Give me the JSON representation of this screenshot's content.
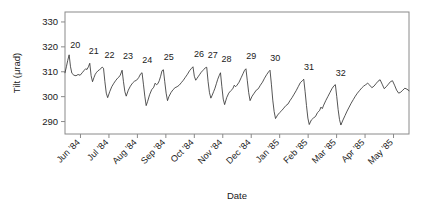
{
  "chart_data": {
    "type": "line",
    "title": "",
    "subtitle": "",
    "xlabel": "Date",
    "ylabel": "Tilt (μrad)",
    "ylim": [
      285,
      334
    ],
    "yticks": [
      290,
      300,
      310,
      320,
      330
    ],
    "ytick_labels": [
      "290",
      "300",
      "310",
      "320",
      "330"
    ],
    "xlim": [
      "1984-05-15",
      "1985-06-05"
    ],
    "xtick_labels": [
      "Jun '84",
      "Jul '84",
      "Aug '84",
      "Sep '84",
      "Oct '84",
      "Nov '84",
      "Dec '84",
      "Jan '85",
      "Feb '85",
      "Mar '85",
      "Apr '85",
      "May '85"
    ],
    "grid": false,
    "legend": null,
    "legend_position": "none",
    "line_color": "#2b2b2b",
    "frame_color": "#8a8a8a",
    "annotations": [
      {
        "label": "20",
        "x": 0.012,
        "y": 317.2
      },
      {
        "label": "21",
        "x": 0.066,
        "y": 315.0
      },
      {
        "label": "22",
        "x": 0.112,
        "y": 313.5
      },
      {
        "label": "23",
        "x": 0.166,
        "y": 312.8
      },
      {
        "label": "24",
        "x": 0.222,
        "y": 311.5
      },
      {
        "label": "25",
        "x": 0.284,
        "y": 312.7
      },
      {
        "label": "26",
        "x": 0.372,
        "y": 313.8
      },
      {
        "label": "27",
        "x": 0.412,
        "y": 313.2
      },
      {
        "label": "28",
        "x": 0.452,
        "y": 311.6
      },
      {
        "label": "29",
        "x": 0.524,
        "y": 312.9
      },
      {
        "label": "30",
        "x": 0.594,
        "y": 312.0
      },
      {
        "label": "31",
        "x": 0.692,
        "y": 308.6
      },
      {
        "label": "32",
        "x": 0.784,
        "y": 306.2
      }
    ],
    "series": [
      {
        "name": "Tilt",
        "comment": "Sawtooth: each cycle ramps up slowly then drops sharply. Values in microradians.",
        "points": [
          [
            0.0,
            309.6
          ],
          [
            0.004,
            312.0
          ],
          [
            0.008,
            314.6
          ],
          [
            0.012,
            316.8
          ],
          [
            0.016,
            312.0
          ],
          [
            0.02,
            309.4
          ],
          [
            0.026,
            308.6
          ],
          [
            0.032,
            308.4
          ],
          [
            0.038,
            308.9
          ],
          [
            0.044,
            308.6
          ],
          [
            0.05,
            309.6
          ],
          [
            0.056,
            310.6
          ],
          [
            0.06,
            311.2
          ],
          [
            0.064,
            310.9
          ],
          [
            0.068,
            312.0
          ],
          [
            0.072,
            313.4
          ],
          [
            0.076,
            308.4
          ],
          [
            0.08,
            306.0
          ],
          [
            0.084,
            307.6
          ],
          [
            0.088,
            309.0
          ],
          [
            0.092,
            309.8
          ],
          [
            0.096,
            310.4
          ],
          [
            0.1,
            310.8
          ],
          [
            0.104,
            311.2
          ],
          [
            0.108,
            311.9
          ],
          [
            0.112,
            311.4
          ],
          [
            0.116,
            306.0
          ],
          [
            0.12,
            301.4
          ],
          [
            0.124,
            299.6
          ],
          [
            0.13,
            302.0
          ],
          [
            0.136,
            304.0
          ],
          [
            0.142,
            305.4
          ],
          [
            0.148,
            306.6
          ],
          [
            0.154,
            307.6
          ],
          [
            0.16,
            308.4
          ],
          [
            0.166,
            310.6
          ],
          [
            0.17,
            306.0
          ],
          [
            0.174,
            302.0
          ],
          [
            0.178,
            300.2
          ],
          [
            0.184,
            302.6
          ],
          [
            0.19,
            304.2
          ],
          [
            0.196,
            305.4
          ],
          [
            0.202,
            306.2
          ],
          [
            0.208,
            306.6
          ],
          [
            0.214,
            307.6
          ],
          [
            0.22,
            309.2
          ],
          [
            0.224,
            309.6
          ],
          [
            0.228,
            305.0
          ],
          [
            0.232,
            300.2
          ],
          [
            0.236,
            296.4
          ],
          [
            0.24,
            298.0
          ],
          [
            0.246,
            300.8
          ],
          [
            0.252,
            302.8
          ],
          [
            0.258,
            303.8
          ],
          [
            0.262,
            305.4
          ],
          [
            0.266,
            304.8
          ],
          [
            0.27,
            305.2
          ],
          [
            0.274,
            306.4
          ],
          [
            0.278,
            308.2
          ],
          [
            0.282,
            310.4
          ],
          [
            0.286,
            310.8
          ],
          [
            0.29,
            306.0
          ],
          [
            0.294,
            301.4
          ],
          [
            0.298,
            298.4
          ],
          [
            0.302,
            300.0
          ],
          [
            0.308,
            301.6
          ],
          [
            0.314,
            302.8
          ],
          [
            0.32,
            303.6
          ],
          [
            0.326,
            304.0
          ],
          [
            0.332,
            304.6
          ],
          [
            0.338,
            305.6
          ],
          [
            0.344,
            306.6
          ],
          [
            0.35,
            307.8
          ],
          [
            0.356,
            309.0
          ],
          [
            0.362,
            310.4
          ],
          [
            0.368,
            311.4
          ],
          [
            0.372,
            312.0
          ],
          [
            0.376,
            308.2
          ],
          [
            0.38,
            306.6
          ],
          [
            0.384,
            307.4
          ],
          [
            0.388,
            308.2
          ],
          [
            0.392,
            309.0
          ],
          [
            0.396,
            309.8
          ],
          [
            0.4,
            310.4
          ],
          [
            0.404,
            311.0
          ],
          [
            0.408,
            311.6
          ],
          [
            0.412,
            311.8
          ],
          [
            0.416,
            306.0
          ],
          [
            0.42,
            301.6
          ],
          [
            0.424,
            299.4
          ],
          [
            0.428,
            300.6
          ],
          [
            0.432,
            302.0
          ],
          [
            0.436,
            303.4
          ],
          [
            0.44,
            305.2
          ],
          [
            0.444,
            307.0
          ],
          [
            0.448,
            308.4
          ],
          [
            0.452,
            309.6
          ],
          [
            0.456,
            304.0
          ],
          [
            0.46,
            299.0
          ],
          [
            0.464,
            296.8
          ],
          [
            0.47,
            299.6
          ],
          [
            0.476,
            301.4
          ],
          [
            0.482,
            302.4
          ],
          [
            0.488,
            303.2
          ],
          [
            0.492,
            304.6
          ],
          [
            0.496,
            304.0
          ],
          [
            0.5,
            304.6
          ],
          [
            0.506,
            305.8
          ],
          [
            0.512,
            307.6
          ],
          [
            0.518,
            309.4
          ],
          [
            0.522,
            310.6
          ],
          [
            0.526,
            311.2
          ],
          [
            0.53,
            306.4
          ],
          [
            0.534,
            301.6
          ],
          [
            0.538,
            298.4
          ],
          [
            0.544,
            300.2
          ],
          [
            0.55,
            301.4
          ],
          [
            0.556,
            302.6
          ],
          [
            0.562,
            303.2
          ],
          [
            0.568,
            304.6
          ],
          [
            0.574,
            305.8
          ],
          [
            0.58,
            307.4
          ],
          [
            0.586,
            308.8
          ],
          [
            0.592,
            310.0
          ],
          [
            0.596,
            310.6
          ],
          [
            0.6,
            305.0
          ],
          [
            0.604,
            298.6
          ],
          [
            0.608,
            294.0
          ],
          [
            0.612,
            291.2
          ],
          [
            0.618,
            292.6
          ],
          [
            0.624,
            293.6
          ],
          [
            0.63,
            294.4
          ],
          [
            0.636,
            295.4
          ],
          [
            0.642,
            296.4
          ],
          [
            0.648,
            297.0
          ],
          [
            0.654,
            298.4
          ],
          [
            0.66,
            299.6
          ],
          [
            0.666,
            301.0
          ],
          [
            0.672,
            302.4
          ],
          [
            0.678,
            304.0
          ],
          [
            0.684,
            305.6
          ],
          [
            0.69,
            306.4
          ],
          [
            0.694,
            307.0
          ],
          [
            0.698,
            302.0
          ],
          [
            0.702,
            296.4
          ],
          [
            0.706,
            291.4
          ],
          [
            0.71,
            288.8
          ],
          [
            0.716,
            290.6
          ],
          [
            0.722,
            291.4
          ],
          [
            0.728,
            292.0
          ],
          [
            0.734,
            293.6
          ],
          [
            0.74,
            294.4
          ],
          [
            0.744,
            295.8
          ],
          [
            0.748,
            295.2
          ],
          [
            0.752,
            296.6
          ],
          [
            0.758,
            298.4
          ],
          [
            0.764,
            300.0
          ],
          [
            0.77,
            301.6
          ],
          [
            0.776,
            303.2
          ],
          [
            0.782,
            304.4
          ],
          [
            0.786,
            304.8
          ],
          [
            0.79,
            300.0
          ],
          [
            0.794,
            294.8
          ],
          [
            0.798,
            290.8
          ],
          [
            0.802,
            288.6
          ],
          [
            0.808,
            290.6
          ],
          [
            0.814,
            292.4
          ],
          [
            0.82,
            294.2
          ],
          [
            0.826,
            295.8
          ],
          [
            0.832,
            297.4
          ],
          [
            0.838,
            298.8
          ],
          [
            0.844,
            300.2
          ],
          [
            0.85,
            301.4
          ],
          [
            0.856,
            302.4
          ],
          [
            0.862,
            303.4
          ],
          [
            0.868,
            304.2
          ],
          [
            0.874,
            304.8
          ],
          [
            0.88,
            305.4
          ],
          [
            0.886,
            304.6
          ],
          [
            0.892,
            303.6
          ],
          [
            0.898,
            304.2
          ],
          [
            0.904,
            305.2
          ],
          [
            0.91,
            306.2
          ],
          [
            0.916,
            306.8
          ],
          [
            0.922,
            305.0
          ],
          [
            0.928,
            303.2
          ],
          [
            0.934,
            304.0
          ],
          [
            0.94,
            305.0
          ],
          [
            0.946,
            306.0
          ],
          [
            0.952,
            306.4
          ],
          [
            0.958,
            304.6
          ],
          [
            0.964,
            302.6
          ],
          [
            0.97,
            301.4
          ],
          [
            0.976,
            301.8
          ],
          [
            0.982,
            302.6
          ],
          [
            0.988,
            303.4
          ],
          [
            0.994,
            303.0
          ],
          [
            1.0,
            302.4
          ]
        ]
      }
    ]
  }
}
